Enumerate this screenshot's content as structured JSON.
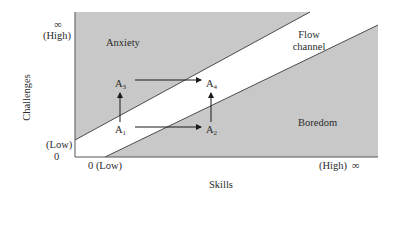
{
  "diagram": {
    "axes": {
      "x_label": "Skills",
      "y_label": "Challenges",
      "x_min_label": "0 (Low)",
      "x_max_label": "(High)",
      "x_max_symbol": "∞",
      "y_min_label": "(Low)",
      "y_min_value": "0",
      "y_max_label": "(High)",
      "y_max_symbol": "∞"
    },
    "regions": [
      {
        "name": "anxiety",
        "label": "Anxiety"
      },
      {
        "name": "flow",
        "label_line1": "Flow",
        "label_line2": "channel"
      },
      {
        "name": "boredom",
        "label": "Boredom"
      }
    ],
    "points": [
      {
        "id": "A1",
        "letter": "A",
        "sub": "1"
      },
      {
        "id": "A2",
        "letter": "A",
        "sub": "2"
      },
      {
        "id": "A3",
        "letter": "A",
        "sub": "3"
      },
      {
        "id": "A4",
        "letter": "A",
        "sub": "4"
      }
    ],
    "arrows": [
      {
        "from": "A1",
        "to": "A3"
      },
      {
        "from": "A1",
        "to": "A2"
      },
      {
        "from": "A3",
        "to": "A4"
      },
      {
        "from": "A2",
        "to": "A4"
      }
    ],
    "colors": {
      "region_fill": "#c8c8c8",
      "line": "#3a3a3a",
      "background": "#ffffff"
    }
  }
}
